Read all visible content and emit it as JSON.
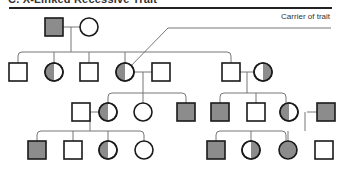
{
  "title": "C. X-Linked Recessive Trait",
  "callout": {
    "label": "Carrier of trait"
  },
  "legend_colors": {
    "affected_fill": "#8c8c8c",
    "stroke": "#1a1a1a",
    "line": "#777777"
  },
  "pedigree": {
    "generations": [
      {
        "gen": "I",
        "individuals": [
          {
            "sex": "male",
            "status": "affected"
          },
          {
            "sex": "female",
            "status": "unaffected"
          }
        ]
      },
      {
        "gen": "II",
        "individuals": [
          {
            "sex": "male",
            "status": "unaffected"
          },
          {
            "sex": "female",
            "status": "carrier"
          },
          {
            "sex": "male",
            "status": "unaffected"
          },
          {
            "sex": "female",
            "status": "carrier"
          },
          {
            "sex": "male",
            "status": "unaffected",
            "note": "spouse"
          },
          {
            "sex": "male",
            "status": "unaffected"
          },
          {
            "sex": "female",
            "status": "carrier",
            "note": "spouse"
          }
        ]
      },
      {
        "gen": "III",
        "individuals": [
          {
            "sex": "male",
            "status": "unaffected",
            "note": "spouse"
          },
          {
            "sex": "female",
            "status": "carrier"
          },
          {
            "sex": "female",
            "status": "unaffected"
          },
          {
            "sex": "male",
            "status": "affected"
          },
          {
            "sex": "male",
            "status": "affected"
          },
          {
            "sex": "male",
            "status": "unaffected"
          },
          {
            "sex": "female",
            "status": "carrier"
          },
          {
            "sex": "male",
            "status": "affected",
            "note": "spouse"
          }
        ]
      },
      {
        "gen": "IV",
        "individuals": [
          {
            "sex": "male",
            "status": "affected"
          },
          {
            "sex": "male",
            "status": "unaffected"
          },
          {
            "sex": "female",
            "status": "carrier"
          },
          {
            "sex": "female",
            "status": "unaffected"
          },
          {
            "sex": "male",
            "status": "affected"
          },
          {
            "sex": "female",
            "status": "carrier"
          },
          {
            "sex": "female",
            "status": "affected"
          },
          {
            "sex": "male",
            "status": "unaffected"
          }
        ]
      }
    ]
  }
}
